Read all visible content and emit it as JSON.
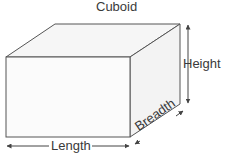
{
  "diagram": {
    "title": "Cuboid",
    "labels": {
      "height": "Height",
      "length": "Length",
      "breadth": "Breadth"
    },
    "shape": {
      "type": "cuboid",
      "front_face": {
        "x1": 6,
        "y1": 57,
        "x2": 130,
        "y2": 137
      },
      "depth_offset": {
        "dx": 50,
        "dy": -33
      }
    },
    "colors": {
      "edge": "#555555",
      "face_front": "#fbfbfb",
      "face_top": "#f6f6f6",
      "face_right": "#f3f3f3",
      "text": "#3a3a3a",
      "arrow": "#444444"
    }
  }
}
